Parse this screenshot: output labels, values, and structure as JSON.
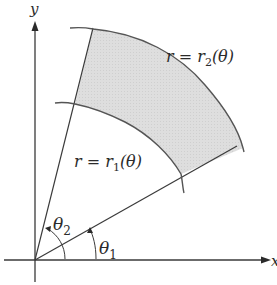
{
  "figure": {
    "axes": {
      "x_label": "x",
      "y_label": "y"
    },
    "region": {
      "description": "Polar region bounded by two rays and two curves",
      "fill_color": "#dcdcdc",
      "stroke_color": "#555555"
    },
    "curves": {
      "outer": {
        "label_prefix": "r = r",
        "label_sub": "2",
        "label_suffix": "(θ)"
      },
      "inner": {
        "label_prefix": "r = r",
        "label_sub": "1",
        "label_suffix": "(θ)"
      }
    },
    "angles": {
      "theta1": {
        "symbol": "θ",
        "sub": "1"
      },
      "theta2": {
        "symbol": "θ",
        "sub": "2"
      }
    }
  }
}
